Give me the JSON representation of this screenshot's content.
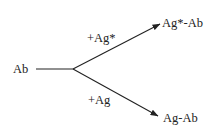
{
  "diagram": {
    "source": {
      "label": "Ab"
    },
    "branches": [
      {
        "reagent": "+Ag*",
        "product": "Ag*-Ab"
      },
      {
        "reagent": "+Ag",
        "product": "Ag-Ab"
      }
    ],
    "colors": {
      "stroke": "#222222",
      "text": "#222222",
      "background": "#ffffff"
    }
  }
}
